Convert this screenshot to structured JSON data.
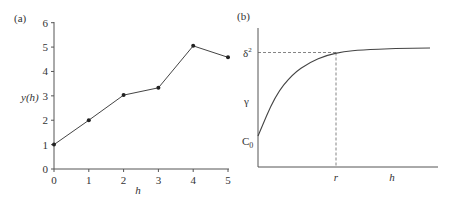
{
  "chart_data": [
    {
      "type": "line",
      "panel_label": "(a)",
      "title": "",
      "xlabel": "h",
      "ylabel": "y(h)",
      "x": [
        0,
        1,
        2,
        3,
        4,
        5
      ],
      "values": [
        1.0,
        2.0,
        3.03,
        3.33,
        5.05,
        4.58
      ],
      "xlim": [
        0,
        5
      ],
      "ylim": [
        0,
        6
      ],
      "xticks": [
        "0",
        "1",
        "2",
        "3",
        "4",
        "5"
      ],
      "yticks": [
        "0",
        "1",
        "2",
        "3",
        "4",
        "5",
        "6"
      ],
      "markers": true,
      "grid": false,
      "legend": null
    },
    {
      "type": "line",
      "panel_label": "(b)",
      "title": "",
      "xlabel": "h",
      "ylabel": "",
      "description": "Idealized variogram: curve rises from nugget C0 and levels off at sill δ² near range r",
      "y_annotations": [
        "δ²",
        "γ",
        "C₀"
      ],
      "x_annotations": [
        "r",
        "h"
      ],
      "reference_lines": [
        {
          "type": "horizontal-dashed",
          "at": "δ²",
          "to_x": "r"
        },
        {
          "type": "vertical-dashed",
          "at": "r",
          "to_y": "δ²"
        }
      ],
      "curve_samples_normalized": {
        "x": [
          0,
          0.1,
          0.2,
          0.3,
          0.4,
          0.5,
          0.6,
          0.8,
          1.0
        ],
        "y": [
          0.26,
          0.6,
          0.78,
          0.88,
          0.94,
          0.97,
          0.985,
          0.995,
          1.0
        ]
      },
      "grid": false,
      "legend": null
    }
  ],
  "panel_a": {
    "label": "(a)",
    "ylabel": "y(h)",
    "xlabel": "h",
    "xticks": [
      "0",
      "1",
      "2",
      "3",
      "4",
      "5"
    ],
    "yticks": [
      "0",
      "1",
      "2",
      "3",
      "4",
      "5",
      "6"
    ]
  },
  "panel_b": {
    "label": "(b)",
    "sill_label": "δ",
    "sill_sup": "2",
    "gamma_label": "γ",
    "nugget_label": "C",
    "nugget_sub": "0",
    "range_label": "r",
    "xlabel": "h"
  }
}
